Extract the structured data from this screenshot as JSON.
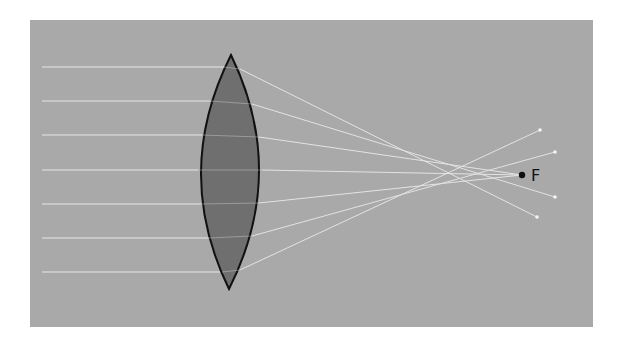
{
  "diagram": {
    "type": "converging-lens-ray-diagram",
    "colors": {
      "page_background": "#ffffff",
      "panel_background": "#a9a9a9",
      "lens_fill": "#6f6f6f",
      "lens_stroke": "#111111",
      "ray_color": "#eeeeee",
      "focal_point_color": "#111111"
    },
    "focal_point": {
      "label": "F",
      "x": 522,
      "y": 175
    },
    "incoming_rays_y": [
      67,
      101,
      135,
      170,
      204,
      238,
      272
    ],
    "rays_start_x": 42,
    "refracted_ray_endpoints": [
      {
        "x": 540,
        "y": 130
      },
      {
        "x": 555,
        "y": 152
      },
      {
        "x": 522,
        "y": 175
      },
      {
        "x": 555,
        "y": 197
      },
      {
        "x": 537,
        "y": 217
      }
    ]
  }
}
